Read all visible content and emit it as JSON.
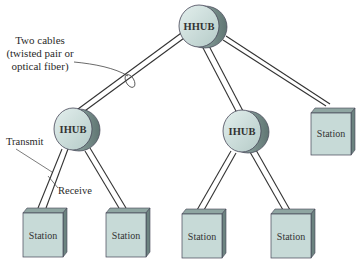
{
  "diagram": {
    "type": "star-hub-topology",
    "colors": {
      "node_fill": "#c9dcd9",
      "node_side": "#8fa6a2",
      "node_dark": "#5f7572",
      "station_fill": "#c7dad7",
      "station_side": "#7f9692",
      "cable": "#333333",
      "text": "#2a2a2a"
    },
    "hubs": [
      {
        "id": "hhub",
        "label": "HHUB"
      },
      {
        "id": "ihub-left",
        "label": "IHUB"
      },
      {
        "id": "ihub-right",
        "label": "IHUB"
      }
    ],
    "stations": [
      {
        "id": "station-1",
        "label": "Station"
      },
      {
        "id": "station-2",
        "label": "Station"
      },
      {
        "id": "station-3",
        "label": "Station"
      },
      {
        "id": "station-4",
        "label": "Station"
      },
      {
        "id": "station-5",
        "label": "Station"
      }
    ],
    "annotations": {
      "cables_line1": "Two cables",
      "cables_line2": "(twisted pair or",
      "cables_line3": "optical fiber)",
      "transmit": "Transmit",
      "receive": "Receive"
    },
    "links": [
      {
        "from": "hhub",
        "to": "ihub-left"
      },
      {
        "from": "hhub",
        "to": "ihub-right"
      },
      {
        "from": "hhub",
        "to": "station-5"
      },
      {
        "from": "ihub-left",
        "to": "station-1"
      },
      {
        "from": "ihub-left",
        "to": "station-2"
      },
      {
        "from": "ihub-right",
        "to": "station-3"
      },
      {
        "from": "ihub-right",
        "to": "station-4"
      }
    ]
  }
}
